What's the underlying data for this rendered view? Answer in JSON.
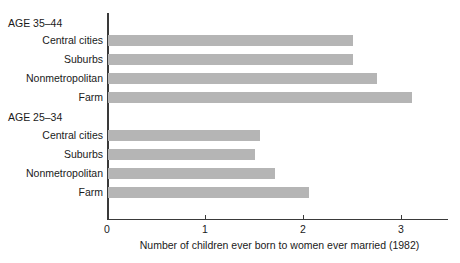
{
  "chart_data": {
    "type": "bar",
    "orientation": "horizontal",
    "title": "",
    "xlabel": "Number of children ever born to women ever married (1982)",
    "ylabel": "",
    "xlim": [
      0,
      3.48
    ],
    "xticks": [
      0,
      1,
      2,
      3
    ],
    "xtick_labels": [
      "0",
      "1",
      "2",
      "3"
    ],
    "grid": false,
    "legend": null,
    "bar_color": "#b5b5b5",
    "axis_color": "#3a3a3a",
    "groups": [
      {
        "label": "AGE 35–44",
        "categories": [
          "Central cities",
          "Suburbs",
          "Nonmetropolitan",
          "Farm"
        ],
        "values": [
          2.5,
          2.5,
          2.75,
          3.1
        ]
      },
      {
        "label": "AGE 25–34",
        "categories": [
          "Central cities",
          "Suburbs",
          "Nonmetropolitan",
          "Farm"
        ],
        "values": [
          1.55,
          1.5,
          1.7,
          2.05
        ]
      }
    ],
    "categories": [
      "AGE 35–44",
      "Central cities",
      "Suburbs",
      "Nonmetropolitan",
      "Farm",
      "AGE 25–34",
      "Central cities",
      "Suburbs",
      "Nonmetropolitan",
      "Farm"
    ],
    "values": [
      null,
      2.5,
      2.5,
      2.75,
      3.1,
      null,
      1.55,
      1.5,
      1.7,
      2.05
    ]
  },
  "labels": {
    "group1_header": "AGE 35–44",
    "g1_row1": "Central cities",
    "g1_row2": "Suburbs",
    "g1_row3": "Nonmetropolitan",
    "g1_row4": "Farm",
    "group2_header": "AGE 25–34",
    "g2_row1": "Central cities",
    "g2_row2": "Suburbs",
    "g2_row3": "Nonmetropolitan",
    "g2_row4": "Farm"
  },
  "axis": {
    "tick0": "0",
    "tick1": "1",
    "tick2": "2",
    "tick3": "3",
    "caption": "Number of children ever born to women ever married (1982)"
  }
}
